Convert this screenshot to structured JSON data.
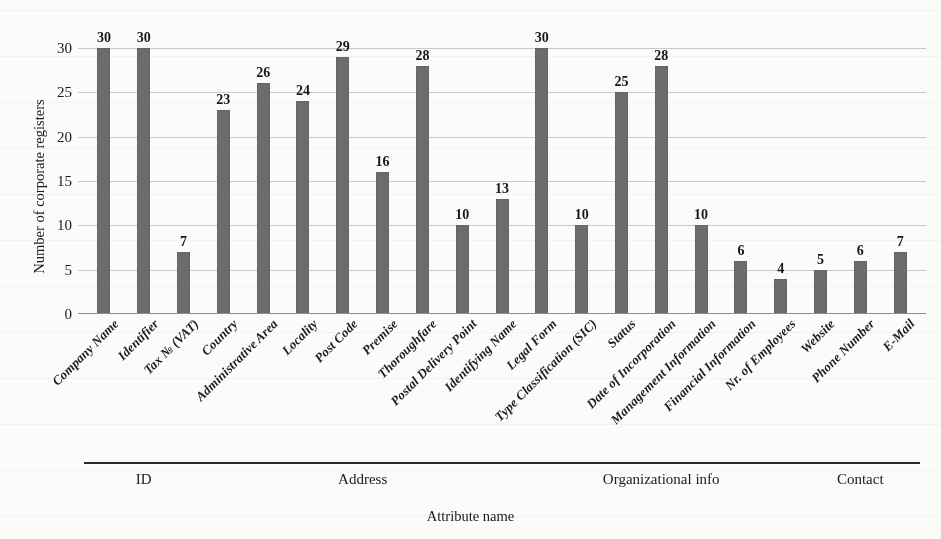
{
  "chart_data": {
    "type": "bar",
    "title": "",
    "xlabel": "Attribute name",
    "ylabel": "Number of corporate registers",
    "ylim": [
      0,
      30
    ],
    "yticks": [
      0,
      5,
      10,
      15,
      20,
      25,
      30
    ],
    "grid": true,
    "legend": "none",
    "bar_color": "#6c6c6c",
    "categories": [
      "Company Name",
      "Identifier",
      "Tax № (VAT)",
      "Country",
      "Administrative Area",
      "Locality",
      "Post Code",
      "Premise",
      "Thoroughfare",
      "Postal Delivery Point",
      "Identifying Name",
      "Legal Form",
      "Type Classification (SIC)",
      "Status",
      "Date of Incorporation",
      "Management Information",
      "Financial Information",
      "Nr. of Employees",
      "Website",
      "Phone Number",
      "E-Mail"
    ],
    "values": [
      30,
      30,
      7,
      23,
      26,
      24,
      29,
      16,
      28,
      10,
      13,
      30,
      10,
      25,
      28,
      10,
      6,
      4,
      5,
      6,
      7
    ],
    "groups": [
      {
        "label": "ID",
        "start_index": 0,
        "end_index": 2
      },
      {
        "label": "Address",
        "start_index": 3,
        "end_index": 10
      },
      {
        "label": "Organizational info",
        "start_index": 11,
        "end_index": 17
      },
      {
        "label": "Contact",
        "start_index": 18,
        "end_index": 20
      }
    ]
  }
}
